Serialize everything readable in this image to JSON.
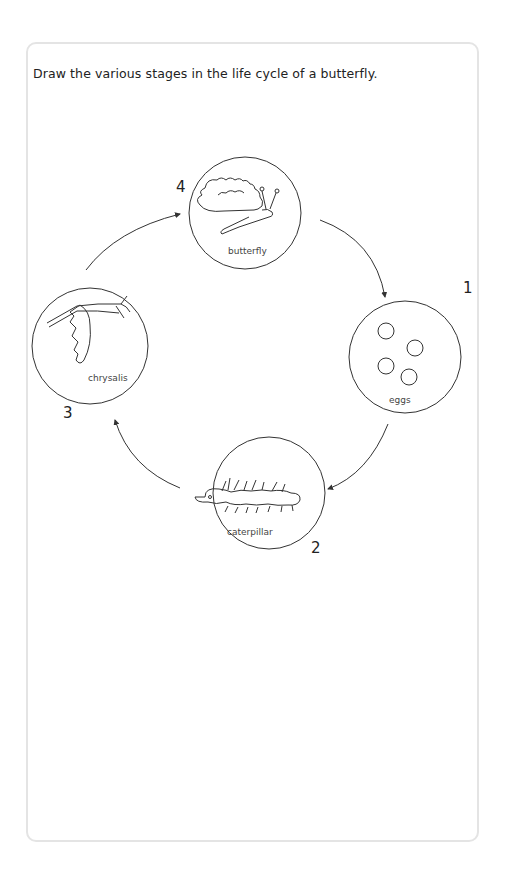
{
  "worksheet": {
    "instruction": "Draw the various stages in the life cycle of a butterfly."
  },
  "stages": [
    {
      "number": "1",
      "label": "eggs"
    },
    {
      "number": "2",
      "label": "caterpillar"
    },
    {
      "number": "3",
      "label": "chrysalis"
    },
    {
      "number": "4",
      "label": "butterfly"
    }
  ],
  "colors": {
    "line": "#333333",
    "border": "#e4e4e4"
  }
}
